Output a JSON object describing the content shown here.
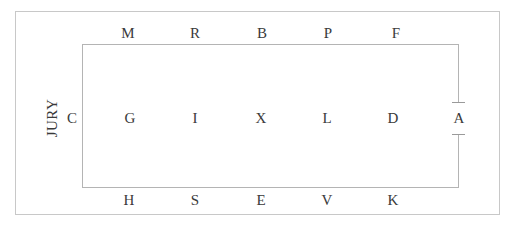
{
  "diagram": {
    "side_label": "JURY",
    "colors": {
      "background": "#ffffff",
      "outer_border": "#c8c8c8",
      "inner_box_line": "#b4b4b4",
      "gap_cap_line": "#9a9a9a",
      "text": "#3a3a3a"
    },
    "rows": {
      "top": {
        "name": "back-row",
        "seats": [
          {
            "label": "M",
            "x": 128,
            "y": 33
          },
          {
            "label": "R",
            "x": 195,
            "y": 33
          },
          {
            "label": "B",
            "x": 262,
            "y": 33
          },
          {
            "label": "P",
            "x": 328,
            "y": 33
          },
          {
            "label": "F",
            "x": 396,
            "y": 33
          }
        ]
      },
      "middle": {
        "name": "middle-row",
        "seats": [
          {
            "label": "C",
            "x": 72,
            "y": 118
          },
          {
            "label": "G",
            "x": 130,
            "y": 118
          },
          {
            "label": "I",
            "x": 195,
            "y": 118
          },
          {
            "label": "X",
            "x": 261,
            "y": 118
          },
          {
            "label": "L",
            "x": 327,
            "y": 118
          },
          {
            "label": "D",
            "x": 393,
            "y": 118
          },
          {
            "label": "A",
            "x": 459,
            "y": 118
          }
        ]
      },
      "bottom": {
        "name": "front-row",
        "seats": [
          {
            "label": "H",
            "x": 129,
            "y": 200
          },
          {
            "label": "S",
            "x": 195,
            "y": 200
          },
          {
            "label": "E",
            "x": 261,
            "y": 200
          },
          {
            "label": "V",
            "x": 327,
            "y": 200
          },
          {
            "label": "K",
            "x": 393,
            "y": 200
          }
        ]
      }
    }
  }
}
